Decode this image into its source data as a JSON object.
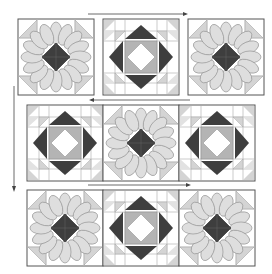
{
  "colors": {
    "background": "#ffffff",
    "outline": "#555555",
    "seam": "#9a9a9a",
    "light_fill": "#d4d4d4",
    "petal_fill": "#dedede",
    "dark_fill": "#3e3e3e",
    "medium_fill": "#b4b4b4",
    "arrow": "#444444"
  },
  "block_types": {
    "flower": "Dresden flower block: 16 petals around dark center square-on-point, light corner triangles",
    "square": "Square-in-a-square block: white center on point, dark flying-geese triangles, light corner half-square triangles"
  },
  "rows": [
    {
      "id": "row-1",
      "joined": false,
      "blocks": [
        "flower",
        "square",
        "flower"
      ],
      "y": 19
    },
    {
      "id": "row-2",
      "joined": true,
      "blocks": [
        "square",
        "flower",
        "square"
      ],
      "y": 105
    },
    {
      "id": "row-3",
      "joined": true,
      "blocks": [
        "flower",
        "square",
        "flower"
      ],
      "y": 190
    }
  ],
  "arrows": [
    {
      "id": "arrow-row-1",
      "direction": "right"
    },
    {
      "id": "arrow-row-2",
      "direction": "left"
    },
    {
      "id": "arrow-row-3",
      "direction": "right"
    },
    {
      "id": "arrow-down",
      "direction": "down"
    }
  ]
}
